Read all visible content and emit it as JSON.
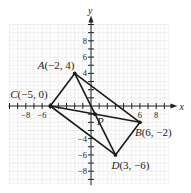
{
  "figure": {
    "type": "coordinate-plane",
    "axes": {
      "x_label": "x",
      "y_label": "y",
      "x_tick_labels": [
        {
          "value": -8,
          "text": "−8"
        },
        {
          "value": -6,
          "text": "−6"
        },
        {
          "value": 6,
          "text": "6"
        },
        {
          "value": 8,
          "text": "8"
        }
      ],
      "y_tick_labels": [
        {
          "value": 8,
          "text": "8"
        },
        {
          "value": 6,
          "text": "6"
        },
        {
          "value": 4,
          "text": "4"
        },
        {
          "value": -4,
          "text": "−4"
        },
        {
          "value": -6,
          "text": "−6"
        },
        {
          "value": -8,
          "text": "−8"
        }
      ],
      "x_range": [
        -10,
        9.5
      ],
      "y_range": [
        -9.6,
        10
      ],
      "grid": true
    },
    "points": [
      {
        "id": "A",
        "label": "A(−2, 4)",
        "x": -2,
        "y": 4
      },
      {
        "id": "B",
        "label": "B(6, −2)",
        "x": 6,
        "y": -2
      },
      {
        "id": "C",
        "label": "C(−5, 0)",
        "x": -5,
        "y": 0
      },
      {
        "id": "D",
        "label": "D(3, −6)",
        "x": 3,
        "y": -6
      },
      {
        "id": "P",
        "label": "P",
        "x": 0.5,
        "y": -1
      }
    ],
    "segments": [
      [
        "C",
        "A"
      ],
      [
        "A",
        "B"
      ],
      [
        "B",
        "D"
      ],
      [
        "D",
        "C"
      ],
      [
        "A",
        "D"
      ],
      [
        "C",
        "B"
      ]
    ]
  },
  "colors": {
    "grid": "#e6e6e6",
    "axis": "#222222",
    "line": "#1a1a1a"
  }
}
